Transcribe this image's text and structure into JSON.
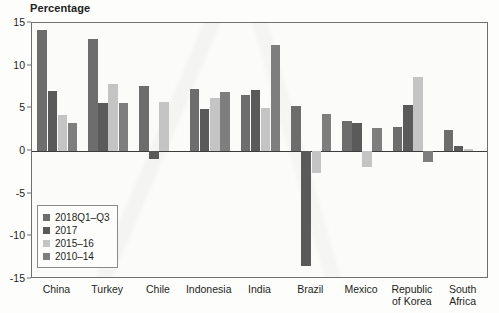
{
  "chart_data": {
    "type": "bar",
    "title": "",
    "ylabel": "Percentage",
    "xlabel": "",
    "ylim": [
      -15,
      15
    ],
    "yticks": [
      15,
      10,
      5,
      0,
      -5,
      -10,
      -15
    ],
    "grid": false,
    "legend_position": "inside-bottom-left",
    "categories": [
      "China",
      "Turkey",
      "Chile",
      "Indonesia",
      "India",
      "Brazil",
      "Mexico",
      "Republic of Korea",
      "South Africa"
    ],
    "series": [
      {
        "name": "2018Q1–Q3",
        "color": "#6d6d6d",
        "values": [
          14.2,
          13.1,
          7.6,
          7.3,
          6.6,
          5.3,
          3.5,
          2.8,
          2.5
        ]
      },
      {
        "name": "2017",
        "color": "#5a5a5a",
        "values": [
          7.0,
          5.6,
          -0.9,
          4.9,
          7.2,
          -13.5,
          3.3,
          5.4,
          0.6
        ]
      },
      {
        "name": "2015–16",
        "color": "#c4c4c4",
        "values": [
          4.2,
          7.8,
          5.7,
          6.2,
          5.0,
          -2.6,
          -1.9,
          8.7,
          0.2
        ]
      },
      {
        "name": "2010–14",
        "color": "#7e7e7e",
        "values": [
          3.3,
          5.6,
          0.0,
          6.9,
          12.4,
          4.3,
          2.7,
          -1.3,
          0.0
        ]
      }
    ]
  },
  "axis": {
    "ylabel": "Percentage"
  }
}
